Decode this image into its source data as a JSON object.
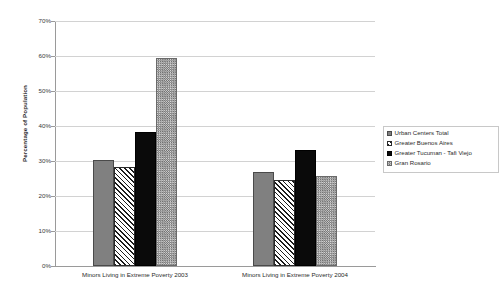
{
  "chart_data": {
    "type": "bar",
    "title": "",
    "xlabel": "",
    "ylabel": "Percentage of Population",
    "ylim": [
      0,
      70
    ],
    "ytick_labels": [
      "70%",
      "60%",
      "50%",
      "40%",
      "30%",
      "20%",
      "10%",
      "0%"
    ],
    "ytick_values": [
      70,
      60,
      50,
      40,
      30,
      20,
      10,
      0
    ],
    "grid": true,
    "legend_position": "right",
    "categories": [
      "Minors Living in Extreme Poverty 2003",
      "Minors Living in Extreme Poverty 2004"
    ],
    "series": [
      {
        "name": "Urban Centers Total",
        "pattern": "solid-gray",
        "color": "#808080",
        "values": [
          30.3,
          26.8
        ]
      },
      {
        "name": "Greater Buenos Aires",
        "pattern": "diagonal-hatch",
        "color": "#1c1c1c",
        "values": [
          28.3,
          24.5
        ]
      },
      {
        "name": "Greater Tucuman - Tafi Viejo",
        "pattern": "solid-black",
        "color": "#0a0a0a",
        "values": [
          38.3,
          33.1
        ]
      },
      {
        "name": "Gran Rosario",
        "pattern": "checker",
        "color": "#a8a8a8",
        "values": [
          59.3,
          25.8
        ]
      }
    ]
  },
  "axis": {
    "y_title": "Percentage of Population"
  },
  "legend": {
    "items": [
      {
        "label": "Urban Centers Total"
      },
      {
        "label": "Greater Buenos Aires"
      },
      {
        "label": "Greater Tucuman - Tafi Viejo"
      },
      {
        "label": "Gran Rosario"
      }
    ]
  }
}
